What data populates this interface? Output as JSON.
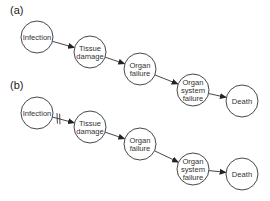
{
  "panels": [
    {
      "label": "(a)",
      "nodes": [
        {
          "id": "infection",
          "lines": [
            "Infection"
          ],
          "cx": 37,
          "cy": 37
        },
        {
          "id": "tissue",
          "lines": [
            "Tissue",
            "damage"
          ],
          "cx": 90,
          "cy": 52
        },
        {
          "id": "organ",
          "lines": [
            "Organ",
            "failure"
          ],
          "cx": 140,
          "cy": 69
        },
        {
          "id": "system",
          "lines": [
            "Organ",
            "system",
            "failure"
          ],
          "cx": 193,
          "cy": 90
        },
        {
          "id": "death",
          "lines": [
            "Death"
          ],
          "cx": 242,
          "cy": 101
        }
      ],
      "edges": [
        {
          "from": "infection",
          "to": "tissue",
          "blocked": false
        },
        {
          "from": "tissue",
          "to": "organ",
          "blocked": false
        },
        {
          "from": "organ",
          "to": "system",
          "blocked": false
        },
        {
          "from": "system",
          "to": "death",
          "blocked": false
        }
      ]
    },
    {
      "label": "(b)",
      "nodes": [
        {
          "id": "infection",
          "lines": [
            "Infection"
          ],
          "cx": 37,
          "cy": 113
        },
        {
          "id": "tissue",
          "lines": [
            "Tissue",
            "damage"
          ],
          "cx": 90,
          "cy": 127
        },
        {
          "id": "organ",
          "lines": [
            "Organ",
            "failure"
          ],
          "cx": 140,
          "cy": 144
        },
        {
          "id": "system",
          "lines": [
            "Organ",
            "system",
            "failure"
          ],
          "cx": 193,
          "cy": 169
        },
        {
          "id": "death",
          "lines": [
            "Death"
          ],
          "cx": 242,
          "cy": 174
        }
      ],
      "edges": [
        {
          "from": "infection",
          "to": "tissue",
          "blocked": true
        },
        {
          "from": "tissue",
          "to": "organ",
          "blocked": false
        },
        {
          "from": "organ",
          "to": "system",
          "blocked": false
        },
        {
          "from": "system",
          "to": "death",
          "blocked": false
        }
      ]
    }
  ],
  "style": {
    "stroke": "#333333",
    "node_radius": 16
  }
}
